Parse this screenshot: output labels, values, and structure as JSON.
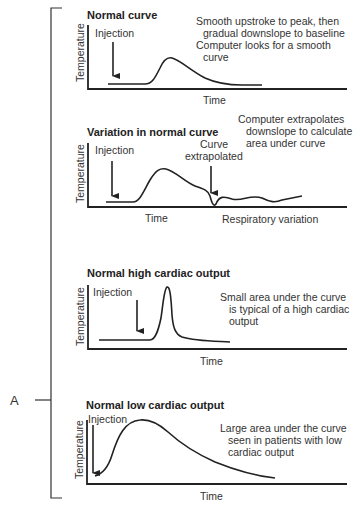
{
  "figure": {
    "label": "A",
    "panels": [
      {
        "title": "Normal curve",
        "injection_label": "Injection",
        "y_axis_label": "Temperature",
        "x_axis_label": "Time",
        "annotation_lines": [
          "Smooth upstroke to peak, then",
          "gradual downslope to baseline",
          "Computer looks for a smooth",
          "curve"
        ]
      },
      {
        "title": "Variation in normal curve",
        "injection_label": "Injection",
        "y_axis_label": "Temperature",
        "x_axis_label": "Time",
        "extrapolated_label_lines": [
          "Curve",
          "extrapolated"
        ],
        "respiratory_label": "Respiratory variation",
        "annotation_lines": [
          "Computer extrapolates",
          "downslope to calculate",
          "area under curve"
        ]
      },
      {
        "title": "Normal high cardiac output",
        "injection_label": "Injection",
        "y_axis_label": "Temperature",
        "x_axis_label": "Time",
        "annotation_lines": [
          "Small area under the curve",
          "is typical of a high cardiac",
          "output"
        ]
      },
      {
        "title": "Normal low cardiac output",
        "injection_label": "Injection",
        "y_axis_label": "Temperature",
        "x_axis_label": "Time",
        "annotation_lines": [
          "Large area under the curve",
          "seen in patients with low",
          "cardiac output"
        ]
      }
    ]
  }
}
